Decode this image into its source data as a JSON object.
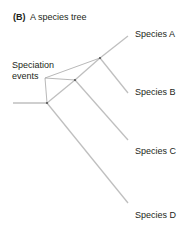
{
  "figure": {
    "panel_letter": "(B)",
    "title": "A species tree"
  },
  "annotation": {
    "line1": "Speciation",
    "line2": "events"
  },
  "species": [
    {
      "label": "Species A"
    },
    {
      "label": "Species B"
    },
    {
      "label": "Species C"
    },
    {
      "label": "Species D"
    }
  ],
  "colors": {
    "branch": "#bfbfbf",
    "pointer": "#a6a6a6",
    "node": "#555555",
    "text": "#231f20"
  }
}
